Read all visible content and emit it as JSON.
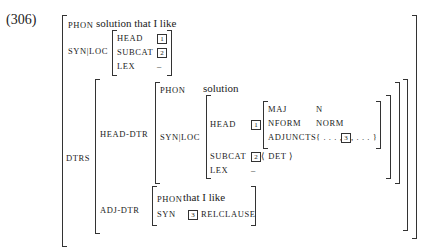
{
  "example_number": "(306)",
  "top": {
    "phon_label": "PHON",
    "phon_value": "solution that I like",
    "synloc_label": "SYN|LOC",
    "synloc": {
      "head_label": "HEAD",
      "head_tag": "1",
      "subcat_label": "SUBCAT",
      "subcat_tag": "2",
      "lex_label": "LEX",
      "lex_value": "–"
    }
  },
  "dtrs": {
    "label": "DTRS",
    "head_dtr": {
      "label": "HEAD-DTR",
      "phon_label": "PHON",
      "phon_value": "solution",
      "synloc_label": "SYN|LOC",
      "head_label": "HEAD",
      "head_tag": "1",
      "head_features": {
        "maj_label": "MAJ",
        "maj_value": "N",
        "nform_label": "NFORM",
        "nform_value": "NORM",
        "adjuncts_label": "ADJUNCTS",
        "adjuncts_pre": "{ . . . ,",
        "adjuncts_tag": "3",
        "adjuncts_post": ", . . . }"
      },
      "subcat_label": "SUBCAT",
      "subcat_tag": "2",
      "subcat_value": "⟨ DET ⟩",
      "lex_label": "LEX",
      "lex_value": "–"
    },
    "adj_dtr": {
      "label": "ADJ-DTR",
      "phon_label": "PHON",
      "phon_value": "that I like",
      "syn_label": "SYN",
      "syn_tag": "3",
      "syn_value": "RELCLAUSE"
    }
  }
}
